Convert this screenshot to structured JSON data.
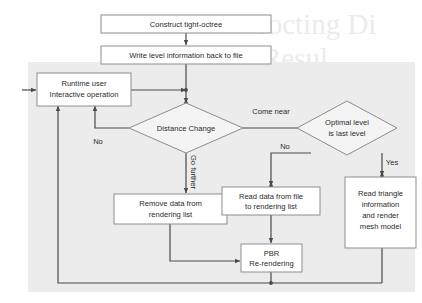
{
  "diagram": {
    "panel_color": "#ececed",
    "line_color": "#4a4a4a",
    "box_fill": "#ffffff",
    "box_stroke": "#8d8d8d",
    "nodes": {
      "construct_octree": {
        "label": "Construct tight-octree",
        "shape": "process"
      },
      "write_level_info": {
        "label": "Write level information back to file",
        "shape": "process"
      },
      "runtime_user_l1": {
        "label": "Runtime user",
        "shape": "process"
      },
      "runtime_user_l2": {
        "label": "Interactive operation",
        "shape": "process"
      },
      "distance_change": {
        "label": "Distance Change",
        "shape": "decision"
      },
      "optimal_level_l1": {
        "label": "Optimal level",
        "shape": "decision"
      },
      "optimal_level_l2": {
        "label": "is last level",
        "shape": "decision"
      },
      "remove_data_l1": {
        "label": "Remove data from",
        "shape": "process"
      },
      "remove_data_l2": {
        "label": "rendering list",
        "shape": "process"
      },
      "read_data_l1": {
        "label": "Read data from file",
        "shape": "process"
      },
      "read_data_l2": {
        "label": "to rendering list",
        "shape": "process"
      },
      "read_triangle_l1": {
        "label": "Read triangle",
        "shape": "process"
      },
      "read_triangle_l2": {
        "label": "information",
        "shape": "process"
      },
      "read_triangle_l3": {
        "label": "and render",
        "shape": "process"
      },
      "read_triangle_l4": {
        "label": "mesh model",
        "shape": "process"
      },
      "pbr_l1": {
        "label": "PBR",
        "shape": "process"
      },
      "pbr_l2": {
        "label": "Re-rendering",
        "shape": "process"
      }
    },
    "edge_labels": {
      "come_near": "Come near",
      "no_left": "No",
      "go_further": "Go further",
      "no_right": "No",
      "yes_right": "Yes"
    },
    "background_text": {
      "line1": "rocting Di",
      "line2": "Resul"
    }
  }
}
